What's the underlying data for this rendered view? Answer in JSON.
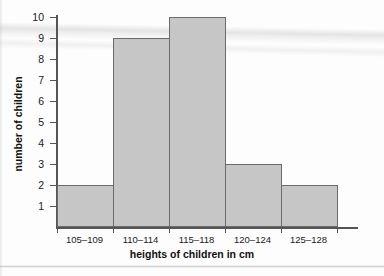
{
  "chart_data": {
    "type": "bar",
    "title": "",
    "subtitle": "",
    "xlabel": "heights of children in cm",
    "ylabel": "number of children",
    "categories": [
      "105–109",
      "110–114",
      "115–118",
      "120–124",
      "125–128"
    ],
    "values": [
      2,
      9,
      10,
      3,
      2
    ],
    "ylim": [
      0,
      10
    ],
    "ytick_labels": [
      "1",
      "2",
      "3",
      "4",
      "5",
      "6",
      "7",
      "8",
      "9",
      "10"
    ],
    "ytick_values": [
      1,
      2,
      3,
      4,
      5,
      6,
      7,
      8,
      9,
      10
    ],
    "grid": false,
    "legend": null,
    "bar_style": "contiguous-histogram",
    "colors": {
      "bar_fill": "#c6c6c6",
      "bar_border": "#6b6b6b",
      "axis": "#555555",
      "text": "#1a1a1a",
      "background": "#fdfdfd"
    }
  }
}
